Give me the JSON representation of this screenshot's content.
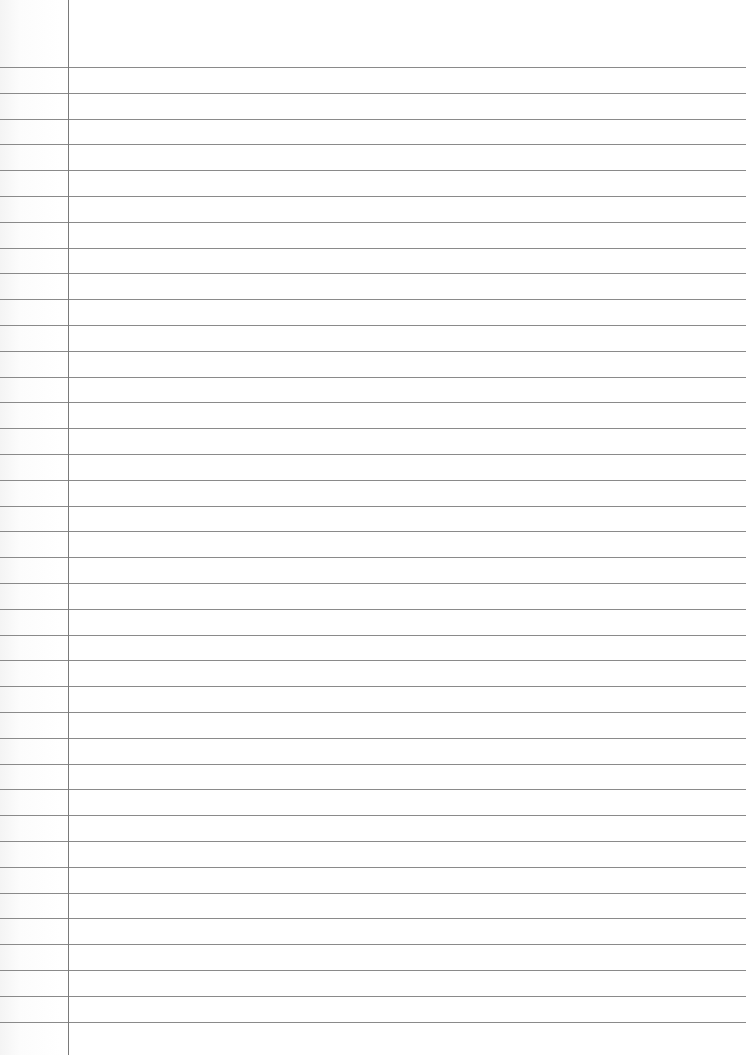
{
  "page": {
    "type": "lined-notebook-paper",
    "background_color": "#ffffff",
    "rule_color": "#8a8a8a",
    "margin_color": "#7a7a7a",
    "margin_x": 68,
    "first_rule_y": 67,
    "rule_spacing": 25.8,
    "rule_count": 38,
    "text": ""
  }
}
